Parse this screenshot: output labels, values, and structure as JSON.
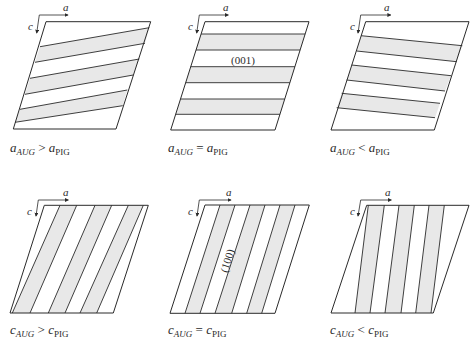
{
  "style": {
    "stroke": "#2a2a2a",
    "band_fill": "#e8e8e8",
    "background": "#ffffff"
  },
  "axes_labels": {
    "horizontal": "a",
    "vertical": "c"
  },
  "panels": [
    {
      "id": "a-greater",
      "condition": {
        "var": "a",
        "sub_left": "AUG",
        "op": ">",
        "sub_right": "PIG"
      },
      "label_pos": [
        10,
        152
      ],
      "outline": [
        [
          46,
          21.7
        ],
        [
          150.7,
          21.7
        ],
        [
          116,
          129
        ],
        [
          13.3,
          129
        ]
      ],
      "lines": [
        [
          [
            40,
            46.7
          ],
          [
            149.3,
            27.7
          ]
        ],
        [
          [
            35,
            62.3
          ],
          [
            145,
            43.3
          ]
        ],
        [
          [
            30,
            78.3
          ],
          [
            139.3,
            59
          ]
        ],
        [
          [
            25,
            94.3
          ],
          [
            133.3,
            75
          ]
        ],
        [
          [
            20,
            109.3
          ],
          [
            127.3,
            90
          ]
        ],
        [
          [
            15,
            122.3
          ],
          [
            122.7,
            105.7
          ]
        ]
      ],
      "bands": [
        [
          0,
          1
        ],
        [
          2,
          3
        ],
        [
          4,
          5
        ]
      ],
      "axes": {
        "corner": [
          39.3,
          15
        ],
        "a_end": [
          68,
          15
        ],
        "c_end": [
          36.7,
          33
        ],
        "a_label": [
          63,
          11
        ],
        "c_label": [
          28,
          30
        ]
      }
    },
    {
      "id": "a-equal",
      "condition": {
        "var": "a",
        "sub_left": "AUG",
        "op": "=",
        "sub_right": "PIG"
      },
      "label_pos": [
        168,
        152
      ],
      "outline": [
        [
          205,
          21.7
        ],
        [
          309,
          21.7
        ],
        [
          275,
          130
        ],
        [
          170.7,
          130
        ]
      ],
      "lines": [
        [
          [
            201.1,
            34
          ],
          [
            305.1,
            34
          ]
        ],
        [
          [
            196,
            50
          ],
          [
            300.1,
            50
          ]
        ],
        [
          [
            190.7,
            66.7
          ],
          [
            294.9,
            66.7
          ]
        ],
        [
          [
            185.7,
            82.7
          ],
          [
            289.8,
            82.7
          ]
        ],
        [
          [
            180.5,
            99
          ],
          [
            284.7,
            99
          ]
        ],
        [
          [
            175.7,
            114.3
          ],
          [
            279.9,
            114.3
          ]
        ]
      ],
      "bands": [
        [
          0,
          1
        ],
        [
          2,
          3
        ],
        [
          4,
          5
        ]
      ],
      "plane_label": {
        "text": "(001)",
        "x": 243,
        "y": 64,
        "rotate": 0
      },
      "axes": {
        "corner": [
          199.3,
          15
        ],
        "a_end": [
          228.3,
          15
        ],
        "c_end": [
          196.7,
          33
        ],
        "a_label": [
          223,
          11
        ],
        "c_label": [
          188,
          30
        ]
      }
    },
    {
      "id": "a-less",
      "condition": {
        "var": "a",
        "sub_left": "AUG",
        "op": "<",
        "sub_right": "PIG"
      },
      "label_pos": [
        330,
        152
      ],
      "outline": [
        [
          365.7,
          21.7
        ],
        [
          469,
          21.7
        ],
        [
          434.3,
          130
        ],
        [
          331,
          130
        ]
      ],
      "lines": [
        [
          [
            361,
            35.7
          ],
          [
            462.3,
            45.7
          ]
        ],
        [
          [
            356.7,
            51
          ],
          [
            456.7,
            61.7
          ]
        ],
        [
          [
            351.7,
            65
          ],
          [
            451,
            75.7
          ]
        ],
        [
          [
            346.7,
            80
          ],
          [
            445,
            91
          ]
        ],
        [
          [
            341.7,
            93.3
          ],
          [
            440,
            103.3
          ]
        ],
        [
          [
            336.7,
            107.7
          ],
          [
            435,
            117.7
          ]
        ]
      ],
      "bands": [
        [
          0,
          1
        ],
        [
          2,
          3
        ],
        [
          4,
          5
        ]
      ],
      "axes": {
        "corner": [
          360.7,
          15
        ],
        "a_end": [
          390.7,
          15
        ],
        "c_end": [
          358,
          33
        ],
        "a_label": [
          384,
          11
        ],
        "c_label": [
          350,
          30
        ]
      }
    },
    {
      "id": "c-greater",
      "condition": {
        "var": "c",
        "sub_left": "AUG",
        "op": ">",
        "sub_right": "PIG"
      },
      "label_pos": [
        10,
        334
      ],
      "outline": [
        [
          44.3,
          205.3
        ],
        [
          148.3,
          205.3
        ],
        [
          113.3,
          313
        ],
        [
          10,
          313
        ]
      ],
      "lines": [
        [
          [
            60,
            205.3
          ],
          [
            12.3,
            313
          ]
        ],
        [
          [
            76.7,
            205.3
          ],
          [
            30,
            313
          ]
        ],
        [
          [
            95,
            205.3
          ],
          [
            48.3,
            313
          ]
        ],
        [
          [
            111.7,
            205.3
          ],
          [
            65,
            313
          ]
        ],
        [
          [
            128.3,
            205.3
          ],
          [
            80,
            313
          ]
        ],
        [
          [
            143.3,
            205.3
          ],
          [
            96.7,
            313
          ]
        ]
      ],
      "bands": [
        [
          0,
          1
        ],
        [
          2,
          3
        ],
        [
          4,
          5
        ]
      ],
      "axes": {
        "corner": [
          38.3,
          200
        ],
        "a_end": [
          68.3,
          200
        ],
        "c_end": [
          36,
          216
        ],
        "a_label": [
          63,
          196
        ],
        "c_label": [
          27,
          215
        ]
      }
    },
    {
      "id": "c-equal",
      "condition": {
        "var": "c",
        "sub_left": "AUG",
        "op": "=",
        "sub_right": "PIG"
      },
      "label_pos": [
        168,
        334
      ],
      "outline": [
        [
          205,
          205
        ],
        [
          309.3,
          205
        ],
        [
          275,
          313.3
        ],
        [
          170,
          313.3
        ]
      ],
      "lines": [
        [
          [
            220,
            205
          ],
          [
            185,
            313.3
          ]
        ],
        [
          [
            235,
            205
          ],
          [
            200,
            313.3
          ]
        ],
        [
          [
            250,
            205
          ],
          [
            215,
            313.3
          ]
        ],
        [
          [
            265,
            205
          ],
          [
            231.7,
            313.3
          ]
        ],
        [
          [
            280,
            205
          ],
          [
            246.7,
            313.3
          ]
        ],
        [
          [
            295,
            205
          ],
          [
            261.7,
            313.3
          ]
        ]
      ],
      "bands": [
        [
          0,
          1
        ],
        [
          2,
          3
        ],
        [
          4,
          5
        ]
      ],
      "plane_label": {
        "text": "(100)",
        "x": 228,
        "y": 264,
        "rotate": -72
      },
      "axes": {
        "corner": [
          199.3,
          200
        ],
        "a_end": [
          231,
          200
        ],
        "c_end": [
          197,
          216
        ],
        "a_label": [
          226,
          196
        ],
        "c_label": [
          188,
          215
        ]
      }
    },
    {
      "id": "c-less",
      "condition": {
        "var": "c",
        "sub_left": "AUG",
        "op": "<",
        "sub_right": "PIG"
      },
      "label_pos": [
        330,
        334
      ],
      "outline": [
        [
          366.7,
          205.3
        ],
        [
          469,
          205.3
        ],
        [
          433.3,
          313
        ],
        [
          331,
          313
        ]
      ],
      "lines": [
        [
          [
            368.3,
            205.3
          ],
          [
            355,
            313
          ]
        ],
        [
          [
            384.3,
            205.3
          ],
          [
            370,
            313
          ]
        ],
        [
          [
            399,
            205.3
          ],
          [
            385,
            313
          ]
        ],
        [
          [
            414.3,
            205.3
          ],
          [
            401,
            313
          ]
        ],
        [
          [
            429,
            205.3
          ],
          [
            415.7,
            313
          ]
        ],
        [
          [
            444.3,
            205.3
          ],
          [
            431,
            313
          ]
        ]
      ],
      "bands": [
        [
          0,
          1
        ],
        [
          2,
          3
        ],
        [
          4,
          5
        ]
      ],
      "axes": {
        "corner": [
          360.7,
          200
        ],
        "a_end": [
          391.3,
          200
        ],
        "c_end": [
          358,
          216
        ],
        "a_label": [
          385,
          196
        ],
        "c_label": [
          350,
          215
        ]
      }
    }
  ]
}
